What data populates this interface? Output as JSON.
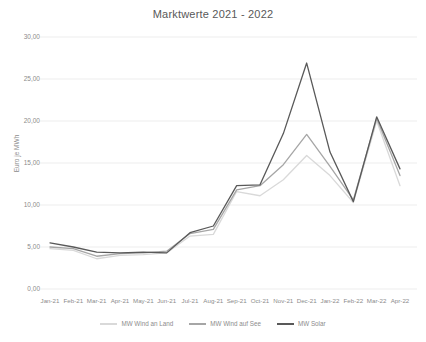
{
  "chart_data": {
    "type": "line",
    "title": "Marktwerte 2021 - 2022",
    "xlabel": "",
    "ylabel": "Euro je MWh",
    "ylim": [
      0,
      30
    ],
    "ytick_step": 5,
    "ytick_labels": [
      "30,00",
      "25,00",
      "20,00",
      "15,00",
      "10,00",
      "5,00",
      "0,00"
    ],
    "ytick_values": [
      30,
      25,
      20,
      15,
      10,
      5,
      0
    ],
    "grid": true,
    "grid_axis": "y",
    "legend_position": "bottom",
    "categories": [
      "Jan-21",
      "Feb-21",
      "Mar-21",
      "Apr-21",
      "May-21",
      "Jun-21",
      "Jul-21",
      "Aug-21",
      "Sep-21",
      "Oct-21",
      "Nov-21",
      "Dec-21",
      "Jan-22",
      "Feb-22",
      "Mar-22",
      "Apr-22"
    ],
    "series": [
      {
        "name": "MW Wind an Land",
        "color": "#d9d9d9",
        "values": [
          4.8,
          4.6,
          3.6,
          4.0,
          4.1,
          4.3,
          6.3,
          6.5,
          11.6,
          11.1,
          13.0,
          15.9,
          13.5,
          10.3,
          20.0,
          12.3
        ]
      },
      {
        "name": "MW Wind auf See",
        "color": "#a6a6a6",
        "values": [
          5.0,
          4.8,
          3.9,
          4.2,
          4.3,
          4.5,
          6.6,
          7.1,
          11.8,
          12.3,
          14.8,
          18.4,
          14.6,
          10.6,
          20.3,
          13.5
        ]
      },
      {
        "name": "MW Solar",
        "color": "#595959",
        "values": [
          5.5,
          5.0,
          4.4,
          4.3,
          4.4,
          4.3,
          6.7,
          7.5,
          12.3,
          12.4,
          18.5,
          26.9,
          16.3,
          10.4,
          20.5,
          14.3
        ]
      }
    ]
  }
}
